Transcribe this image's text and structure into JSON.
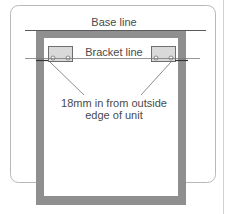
{
  "diagram": {
    "labels": {
      "base_line": "Base line",
      "bracket_line": "Bracket line",
      "note_line1": "18mm in from outside",
      "note_line2": "edge of unit"
    },
    "colors": {
      "frame": "#b8b8b8",
      "panel": "#8f8f8f",
      "bracket_fill": "#d9d9d9",
      "bracket_stroke": "#6e6e6e",
      "line": "#5a5a5a",
      "text": "#4a4a4a",
      "background": "#ffffff"
    },
    "components": {
      "frame": "rounded-border",
      "unit": "cabinet-carcass-front-view",
      "brackets": [
        "left-bracket",
        "right-bracket"
      ],
      "reference_lines": [
        "base-line",
        "bracket-line"
      ]
    }
  }
}
